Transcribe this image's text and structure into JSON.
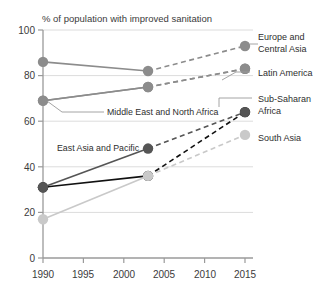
{
  "chart_data": {
    "type": "line",
    "title": "% of population with improved sanitation",
    "xlabel": "",
    "ylabel": "",
    "x": [
      1990,
      2003,
      2015
    ],
    "xlim": [
      1988.5,
      2016.5
    ],
    "ylim": [
      0,
      100
    ],
    "xticks": [
      "1990",
      "1995",
      "2000",
      "2005",
      "2010",
      "2015"
    ],
    "xtick_values": [
      1990,
      1995,
      2000,
      2005,
      2010,
      2015
    ],
    "yticks": [
      "0",
      "20",
      "40",
      "60",
      "80",
      "100"
    ],
    "ytick_values": [
      0,
      20,
      40,
      60,
      80,
      100
    ],
    "grid": "horizontal",
    "legend_position": "inline-annotations",
    "note": "Solid segment 1990-2003 is observed; dashed segment 2003-2015 is projected.",
    "series": [
      {
        "name": "Europe and Central Asia",
        "values": [
          86,
          82,
          93
        ],
        "color": "#8c8c8c",
        "label_side": "right"
      },
      {
        "name": "Latin America",
        "values": [
          69,
          75,
          83
        ],
        "color": "#8c8c8c",
        "label_side": "right"
      },
      {
        "name": "Middle East and North Africa",
        "values": [
          69,
          75,
          83
        ],
        "color": "#8c8c8c",
        "label_side": "inline"
      },
      {
        "name": "Sub-Saharan Africa",
        "values": [
          31,
          36,
          64
        ],
        "color": "#111111",
        "label_side": "right"
      },
      {
        "name": "East Asia and Pacific",
        "values": [
          31,
          48,
          64
        ],
        "color": "#555555",
        "label_side": "inline"
      },
      {
        "name": "South Asia",
        "values": [
          17,
          36,
          54
        ],
        "color": "#c9c9c9",
        "label_side": "right"
      }
    ]
  },
  "axis": {
    "y_100": "100",
    "y_80": "80",
    "y_60": "60",
    "y_40": "40",
    "y_20": "20",
    "y_0": "0",
    "x_1990": "1990",
    "x_1995": "1995",
    "x_2000": "2000",
    "x_2005": "2005",
    "x_2010": "2010",
    "x_2015": "2015"
  },
  "annotations": {
    "title": "% of population with improved sanitation",
    "europe_line1": "Europe and",
    "europe_line2": "Central Asia",
    "latin_america": "Latin America",
    "subsaharan_line1": "Sub-Saharan",
    "subsaharan_line2": "Africa",
    "south_asia": "South Asia",
    "mena": "Middle East and North Africa",
    "east_asia": "East Asia and Pacific"
  },
  "colors": {
    "mid_gray": "#8c8c8c",
    "dark_gray": "#555555",
    "black": "#111111",
    "light_gray": "#c9c9c9",
    "axis": "#9a9a9a",
    "grid": "#dcdcdc",
    "text": "#2e2e2e"
  }
}
